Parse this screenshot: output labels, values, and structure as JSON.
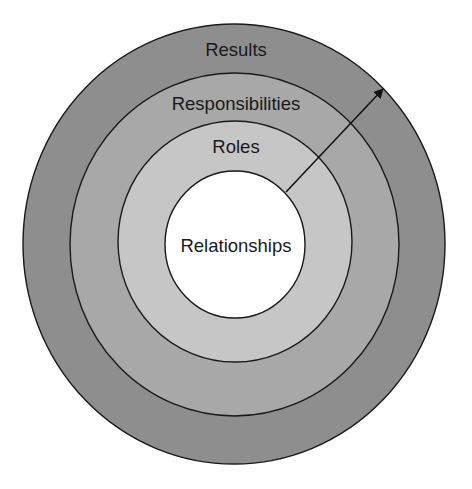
{
  "diagram": {
    "type": "concentric-circles",
    "direction_arrow": "from center outward toward upper-right",
    "rings": [
      {
        "id": "results",
        "label": "Results",
        "level": 4,
        "fill": "#8e8e8e",
        "cx": 234,
        "cy": 244,
        "rx": 211,
        "ry": 220,
        "label_x": 236,
        "label_y": 49
      },
      {
        "id": "responsibilities",
        "label": "Responsibilities",
        "level": 3,
        "fill": "#a8a8a8",
        "cx": 234.5,
        "cy": 244.5,
        "rx": 164.5,
        "ry": 171.5,
        "label_x": 236,
        "label_y": 103
      },
      {
        "id": "roles",
        "label": "Roles",
        "level": 2,
        "fill": "#c6c6c6",
        "cx": 235,
        "cy": 241.5,
        "rx": 117,
        "ry": 120.5,
        "label_x": 236,
        "label_y": 146
      },
      {
        "id": "relationships",
        "label": "Relationships",
        "level": 1,
        "fill": "#ffffff",
        "cx": 235,
        "cy": 244.5,
        "rx": 70,
        "ry": 73.5,
        "label_x": 236,
        "label_y": 245
      }
    ],
    "arrow": {
      "x1": 286,
      "y1": 192,
      "x2": 383,
      "y2": 89,
      "color": "#111111"
    },
    "stroke_color": "#1a1a1a"
  }
}
